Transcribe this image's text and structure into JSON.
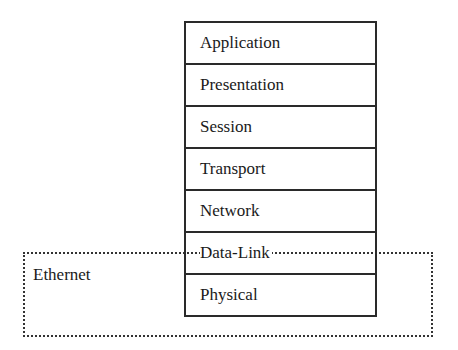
{
  "diagram": {
    "layers": [
      {
        "label": "Application"
      },
      {
        "label": "Presentation"
      },
      {
        "label": "Session"
      },
      {
        "label": "Transport"
      },
      {
        "label": "Network"
      },
      {
        "label": "Data-Link"
      },
      {
        "label": "Physical"
      }
    ],
    "grouping": {
      "label": "Ethernet",
      "covers_layers": [
        "Data-Link",
        "Physical"
      ],
      "border_style": "dotted"
    },
    "colors": {
      "line": "#2a2a2a",
      "dotted": "#333333",
      "background": "#ffffff"
    }
  }
}
